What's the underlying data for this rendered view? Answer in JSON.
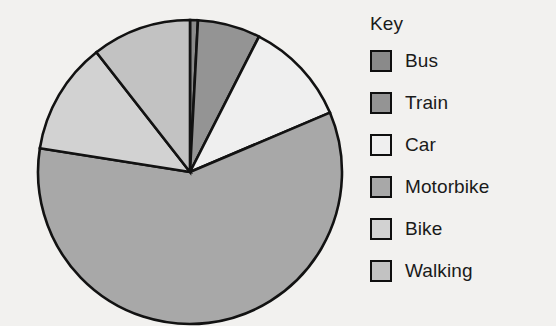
{
  "legend": {
    "title": "Key",
    "items": [
      {
        "label": "Bus",
        "color": "#8a8a8a"
      },
      {
        "label": "Train",
        "color": "#949494"
      },
      {
        "label": "Car",
        "color": "#efefef"
      },
      {
        "label": "Motorbike",
        "color": "#a8a8a8"
      },
      {
        "label": "Bike",
        "color": "#d2d2d2"
      },
      {
        "label": "Walking",
        "color": "#c2c2c2"
      }
    ]
  },
  "chart_data": {
    "type": "pie",
    "title": "",
    "legend_title": "Key",
    "legend_position": "right",
    "start_angle_deg": 0,
    "direction": "clockwise",
    "center": {
      "x": 190,
      "y": 172
    },
    "radius": 152,
    "categories": [
      "Bus",
      "Train",
      "Car",
      "Motorbike",
      "Bike",
      "Walking"
    ],
    "values": [
      3,
      24,
      40,
      212,
      43,
      38
    ],
    "value_unit": "degrees",
    "percentages": [
      0.8,
      6.7,
      11.1,
      58.9,
      11.9,
      10.6
    ],
    "colors": [
      "#8a8a8a",
      "#949494",
      "#efefef",
      "#a8a8a8",
      "#d2d2d2",
      "#c2c2c2"
    ],
    "slices": [
      {
        "label": "Bus",
        "start_deg": 0,
        "end_deg": 3,
        "sweep_deg": 3,
        "percent": 0.8,
        "color": "#8a8a8a"
      },
      {
        "label": "Train",
        "start_deg": 3,
        "end_deg": 27,
        "sweep_deg": 24,
        "percent": 6.7,
        "color": "#949494"
      },
      {
        "label": "Car",
        "start_deg": 27,
        "end_deg": 67,
        "sweep_deg": 40,
        "percent": 11.1,
        "color": "#efefef"
      },
      {
        "label": "Motorbike",
        "start_deg": 67,
        "end_deg": 279,
        "sweep_deg": 212,
        "percent": 58.9,
        "color": "#a8a8a8"
      },
      {
        "label": "Bike",
        "start_deg": 279,
        "end_deg": 322,
        "sweep_deg": 43,
        "percent": 11.9,
        "color": "#d2d2d2"
      },
      {
        "label": "Walking",
        "start_deg": 322,
        "end_deg": 360,
        "sweep_deg": 38,
        "percent": 10.6,
        "color": "#c2c2c2"
      }
    ],
    "outline_color": "#121212",
    "background_color": "#f2f1ef"
  }
}
